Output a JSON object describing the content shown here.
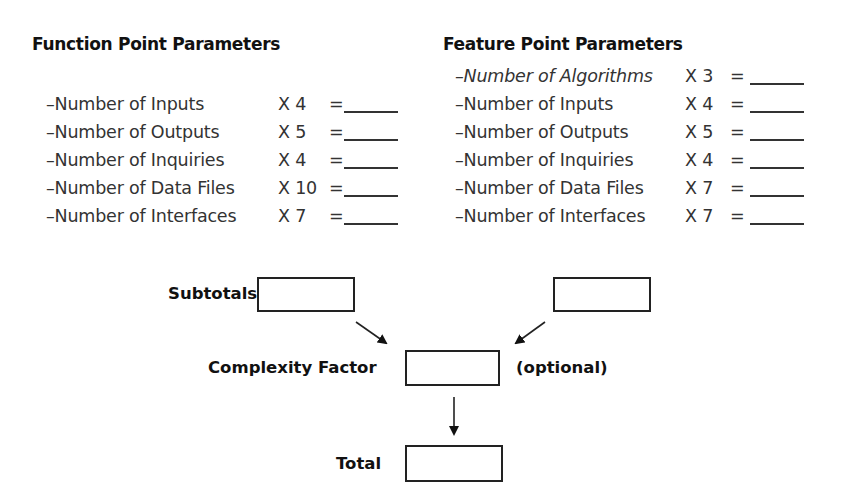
{
  "function_points": {
    "title": "Function Point Parameters",
    "rows": [
      {
        "label": "–Number of Inputs",
        "multiplier": "X 4",
        "equals": "="
      },
      {
        "label": "–Number of Outputs",
        "multiplier": "X 5",
        "equals": "="
      },
      {
        "label": "–Number of Inquiries",
        "multiplier": "X 4",
        "equals": "="
      },
      {
        "label": "–Number of Data Files",
        "multiplier": "X 10",
        "equals": "="
      },
      {
        "label": "–Number of Interfaces",
        "multiplier": "X 7",
        "equals": "="
      }
    ]
  },
  "feature_points": {
    "title": "Feature Point Parameters",
    "rows": [
      {
        "label": "–Number of Algorithms",
        "multiplier": "X 3",
        "equals": "="
      },
      {
        "label": "–Number of Inputs",
        "multiplier": "X 4",
        "equals": "="
      },
      {
        "label": "–Number of Outputs",
        "multiplier": "X 5",
        "equals": "="
      },
      {
        "label": "–Number of Inquiries",
        "multiplier": "X 4",
        "equals": "="
      },
      {
        "label": "–Number of Data Files",
        "multiplier": "X 7",
        "equals": "="
      },
      {
        "label": "–Number of Interfaces",
        "multiplier": "X 7",
        "equals": "="
      }
    ]
  },
  "flow": {
    "subtotals_label": "Subtotals",
    "complexity_label": "Complexity Factor",
    "optional_label": "(optional)",
    "total_label": "Total"
  }
}
